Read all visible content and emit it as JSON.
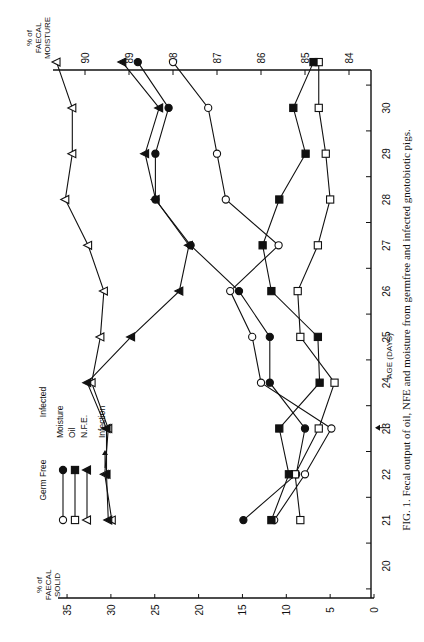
{
  "caption": "FIG. 1.  Fecal output of oil, NFE and moisture from germfree and infected gnotobiotic pigs.",
  "colors": {
    "ink": "#111111",
    "background": "#ffffff"
  },
  "axes": {
    "x_title": "AGE (DAYS)",
    "x_ticks": [
      "20",
      "21",
      "22",
      "23",
      "24",
      "25",
      "26",
      "27",
      "28",
      "29",
      "30"
    ],
    "left_title": [
      "% of",
      "FAECAL",
      "SOLID"
    ],
    "left_ticks": [
      "0",
      "5",
      "10",
      "15",
      "20",
      "25",
      "30",
      "35"
    ],
    "right_title": [
      "% of",
      "FAECAL",
      "MOISTURE"
    ],
    "right_ticks": [
      "84",
      "85",
      "86",
      "87",
      "88",
      "89",
      "90"
    ]
  },
  "legend": {
    "col_germfree": "Germ Free",
    "col_infected": "Infected",
    "rows": [
      {
        "label": "Moisture",
        "gf_marker": "open-circle",
        "inf_marker": "filled-circle"
      },
      {
        "label": "Oil",
        "gf_marker": "open-square",
        "inf_marker": "filled-square"
      },
      {
        "label": "N.F.E.",
        "gf_marker": "open-triangle",
        "inf_marker": "filled-triangle"
      }
    ],
    "infection_label": "Infection"
  },
  "chart_data": {
    "type": "line",
    "title": "FIG. 1. Fecal output of oil, NFE and moisture from germfree and infected gnotobiotic pigs.",
    "orientation_note": "figure printed rotated 90 degrees counter-clockwise",
    "xlabel": "AGE (DAYS)",
    "ylabel_left": "% of FAECAL SOLID",
    "ylabel_right": "% of FAECAL MOISTURE",
    "xlim": [
      19.5,
      30.8
    ],
    "ylim_left": [
      0,
      35
    ],
    "ylim_right": [
      84,
      90
    ],
    "annotation": {
      "text": "Infection",
      "x": 23.5,
      "marker": "arrow"
    },
    "x": [
      20.5,
      21.5,
      22.5,
      23.5,
      24.5,
      25.5,
      26.5,
      27.5,
      28.5,
      29.5,
      30.5
    ],
    "series": [
      {
        "name": "Germ Free Moisture",
        "marker": "open-circle",
        "axis": "right",
        "values": [
          85.7,
          85.0,
          84.4,
          86.0,
          86.2,
          86.7,
          85.6,
          86.8,
          87.0,
          87.2,
          88.0
        ]
      },
      {
        "name": "Infected Moisture",
        "marker": "filled-circle",
        "axis": "right",
        "values": [
          86.4,
          85.2,
          85.0,
          85.8,
          85.8,
          86.5,
          87.6,
          88.4,
          88.4,
          88.1,
          88.8
        ]
      },
      {
        "name": "Germ Free Oil",
        "marker": "open-square",
        "axis": "left",
        "values": [
          8.4,
          9.0,
          6.3,
          4.5,
          8.4,
          8.7,
          6.4,
          5.0,
          5.5,
          6.3,
          6.3
        ]
      },
      {
        "name": "Infected Oil",
        "marker": "filled-square",
        "axis": "left",
        "values": [
          11.7,
          9.7,
          10.8,
          6.2,
          6.4,
          11.7,
          12.7,
          10.8,
          7.8,
          9.2,
          6.9
        ]
      },
      {
        "name": "Germ Free N.F.E.",
        "marker": "open-triangle",
        "axis": "left",
        "values": [
          29.9,
          30.7,
          30.3,
          32.2,
          31.2,
          30.8,
          32.6,
          35.2,
          34.4,
          34.4,
          36.2
        ]
      },
      {
        "name": "Infected N.F.E.",
        "marker": "filled-triangle",
        "axis": "left",
        "values": [
          30.3,
          30.5,
          30.5,
          32.7,
          27.7,
          22.2,
          21.1,
          24.9,
          26.1,
          24.5,
          28.7
        ]
      }
    ],
    "grid": false,
    "legend_position": "upper-left (rotated)"
  }
}
